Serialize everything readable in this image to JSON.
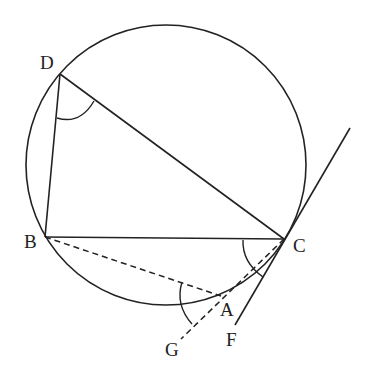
{
  "diagram": {
    "type": "circle-geometry",
    "points": [
      {
        "id": "D",
        "label": "D"
      },
      {
        "id": "B",
        "label": "B"
      },
      {
        "id": "C",
        "label": "C"
      },
      {
        "id": "A",
        "label": "A"
      },
      {
        "id": "F",
        "label": "F"
      },
      {
        "id": "G",
        "label": "G"
      }
    ],
    "segments": [
      {
        "from": "D",
        "to": "B",
        "style": "solid"
      },
      {
        "from": "D",
        "to": "C",
        "style": "solid"
      },
      {
        "from": "B",
        "to": "C",
        "style": "solid"
      },
      {
        "from": "B",
        "to": "A",
        "style": "dashed"
      },
      {
        "from": "C",
        "to": "G",
        "style": "dashed",
        "through": "A"
      },
      {
        "from": "tangent-top",
        "to": "F",
        "style": "solid",
        "note": "tangent at C"
      }
    ],
    "angle_marks": [
      "angle-BDC",
      "angle-BCA",
      "angle-BAG"
    ]
  }
}
